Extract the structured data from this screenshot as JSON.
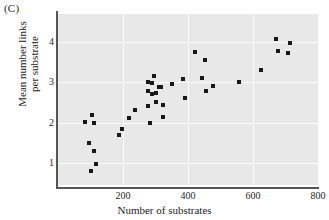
{
  "panel": {
    "label": "(C)"
  },
  "chart_data": {
    "type": "scatter",
    "title": "",
    "subtitle": "",
    "xlabel": "Number of substrates",
    "ylabel_line1": "Mean number links",
    "ylabel_line2": "per substrate",
    "xlim": [
      0,
      800
    ],
    "ylim": [
      0.45,
      4.7
    ],
    "xticks": [
      200,
      400,
      600,
      800
    ],
    "yticks": [
      1,
      2,
      3,
      4
    ],
    "grid": true,
    "legend": null,
    "marker": "square",
    "marker_color": "#181818",
    "plot_background": "#e8e8e8",
    "gridline_color": "#fbfbfb",
    "series": [
      {
        "name": "metabolic networks",
        "points": [
          [
            84,
            2.02
          ],
          [
            94,
            1.5
          ],
          [
            100,
            0.8
          ],
          [
            105,
            2.19
          ],
          [
            110,
            2.0
          ],
          [
            112,
            1.3
          ],
          [
            116,
            0.98
          ],
          [
            188,
            1.7
          ],
          [
            196,
            1.83
          ],
          [
            218,
            2.12
          ],
          [
            236,
            2.32
          ],
          [
            276,
            3.02
          ],
          [
            276,
            2.78
          ],
          [
            278,
            2.42
          ],
          [
            282,
            1.98
          ],
          [
            288,
            2.98
          ],
          [
            288,
            2.72
          ],
          [
            296,
            3.15
          ],
          [
            300,
            2.73
          ],
          [
            302,
            2.52
          ],
          [
            310,
            2.88
          ],
          [
            318,
            2.88
          ],
          [
            322,
            2.43
          ],
          [
            324,
            2.13
          ],
          [
            352,
            2.95
          ],
          [
            386,
            3.08
          ],
          [
            390,
            2.6
          ],
          [
            420,
            3.75
          ],
          [
            444,
            3.11
          ],
          [
            452,
            3.55
          ],
          [
            456,
            2.78
          ],
          [
            478,
            2.9
          ],
          [
            556,
            3.02
          ],
          [
            624,
            3.3
          ],
          [
            672,
            4.08
          ],
          [
            676,
            3.78
          ],
          [
            708,
            3.74
          ],
          [
            714,
            3.98
          ]
        ]
      }
    ]
  }
}
